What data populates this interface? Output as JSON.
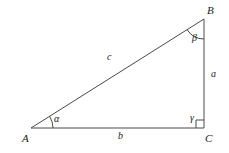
{
  "figure": {
    "type": "right-triangle-diagram",
    "background_color": "#ffffff",
    "stroke_color": "#4a4a4a",
    "label_color": "#1a1a1a",
    "width": 229,
    "height": 153
  },
  "vertices": [
    {
      "key": "A",
      "label": "A",
      "x": 31,
      "y": 128,
      "label_x": 22,
      "label_y": 133
    },
    {
      "key": "B",
      "label": "B",
      "x": 204,
      "y": 19,
      "label_x": 207,
      "label_y": 5
    },
    {
      "key": "C",
      "label": "C",
      "x": 204,
      "y": 128,
      "label_x": 205,
      "label_y": 133
    }
  ],
  "sides": [
    {
      "key": "c",
      "label": "c",
      "from": "A",
      "to": "B",
      "label_x": 107,
      "label_y": 52
    },
    {
      "key": "a",
      "label": "a",
      "from": "B",
      "to": "C",
      "label_x": 211,
      "label_y": 69
    },
    {
      "key": "b",
      "label": "b",
      "from": "A",
      "to": "C",
      "label_x": 118,
      "label_y": 131
    }
  ],
  "angles": [
    {
      "key": "alpha",
      "label": "α",
      "at": "A",
      "label_x": 54,
      "label_y": 114,
      "marker": "arc"
    },
    {
      "key": "beta",
      "label": "β",
      "at": "B",
      "label_x": 192,
      "label_y": 33,
      "marker": "arc"
    },
    {
      "key": "gamma",
      "label": "γ",
      "at": "C",
      "label_x": 190,
      "label_y": 113,
      "marker": "right-angle-square"
    }
  ]
}
